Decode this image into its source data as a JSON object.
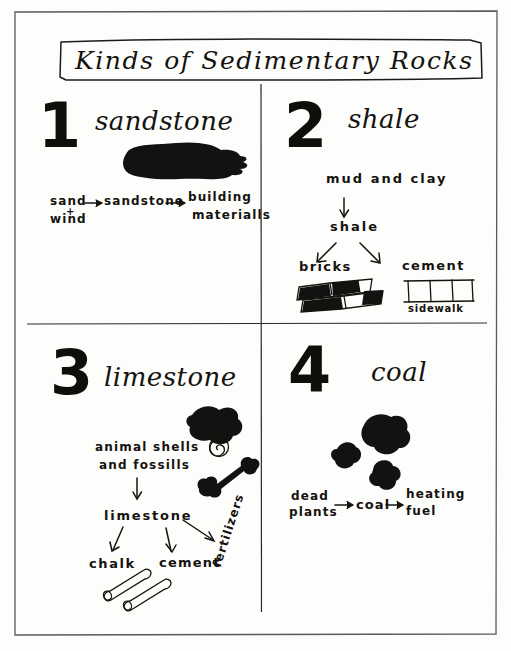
{
  "page": {
    "title": "Kinds of Sedimentary Rocks",
    "background_color": "#fdfdfc",
    "ink_color": "#15130f"
  },
  "quadrants": [
    {
      "number": "1",
      "heading": "sandstone",
      "illustration": "sandstone-rock-blob",
      "flow": {
        "source_line1": "sand",
        "source_plus": "+",
        "source_line2": "wind",
        "arrow1": "→",
        "middle": "sandstone",
        "arrow2": "→",
        "result_line1": "building",
        "result_line2": "materialls"
      }
    },
    {
      "number": "2",
      "heading": "shale",
      "flow": {
        "source": "mud and clay",
        "down_arrow": "↓",
        "middle": "shale",
        "branch_left_label": "bricks",
        "branch_right_label": "cement",
        "branch_right_caption": "sidewalk"
      },
      "illustrations": [
        "bricks-stack",
        "cement-sidewalk"
      ]
    },
    {
      "number": "3",
      "heading": "limestone",
      "flow": {
        "source_line1": "animal shells",
        "source_line2": "and fossills",
        "down_arrow": "↓",
        "middle": "limestone",
        "branch_left_label": "chalk",
        "branch_center_label": "cement",
        "branch_right_label": "fertilizers"
      },
      "illustrations": [
        "shell-rock-blob",
        "snail-shell-spiral",
        "bone",
        "chalk-sticks"
      ]
    },
    {
      "number": "4",
      "heading": "coal",
      "illustration": "coal-lumps",
      "flow": {
        "source_line1": "dead",
        "source_line2": "plants",
        "arrow1": "→",
        "middle": "coal",
        "arrow2": "→",
        "result_line1": "heating",
        "result_line2": "fuel"
      }
    }
  ]
}
